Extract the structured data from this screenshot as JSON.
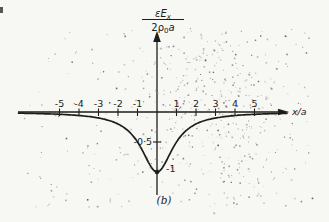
{
  "labels": {
    "ylabel_num_main": "εE",
    "ylabel_num_sub": "x",
    "ylabel_den_main": "2ρ",
    "ylabel_den_sub": "0",
    "ylabel_den_tail": "a",
    "xlabel": "x/a",
    "tick_neg_half": "-0·5",
    "tick_neg_one": "-1",
    "caption": "(b)"
  },
  "chart_data": {
    "type": "line",
    "title": "",
    "xlabel": "x/a",
    "ylabel": "εE_x / (2ρ_0 a)",
    "xlim": [
      -7.1,
      6.7
    ],
    "ylim": [
      -1.4,
      1.3
    ],
    "grid": false,
    "legend": false,
    "x": [
      -5,
      -4,
      -3,
      -2,
      -1,
      0,
      1,
      2,
      3,
      4,
      5
    ],
    "y": [
      -0.04,
      -0.06,
      -0.1,
      -0.2,
      -0.5,
      -1.0,
      -0.5,
      -0.2,
      -0.1,
      -0.06,
      -0.04
    ],
    "curve": {
      "formula": "y = -1/(1+(x/a)^2)",
      "type": "lorentzian",
      "amplitude": -1,
      "width": 1
    },
    "x_ticks": [
      {
        "v": -5,
        "label": "-5"
      },
      {
        "v": -4,
        "label": "-4"
      },
      {
        "v": -3,
        "label": "-3"
      },
      {
        "v": -2,
        "label": "-2"
      },
      {
        "v": -1,
        "label": "-1"
      },
      {
        "v": 1,
        "label": "1"
      },
      {
        "v": 2,
        "label": "2"
      },
      {
        "v": 3,
        "label": "3"
      },
      {
        "v": 4,
        "label": "4"
      },
      {
        "v": 5,
        "label": "5"
      }
    ],
    "y_ticks": [
      {
        "v": -0.5,
        "label": "-0·5"
      },
      {
        "v": -1.0,
        "label": "-1"
      }
    ],
    "annotation": "(b)",
    "ink_color": "#1d1d1b",
    "paper_color": "#f7f7f4"
  }
}
